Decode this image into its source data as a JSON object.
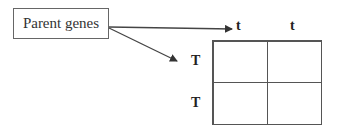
{
  "parent_box": {
    "label": "Parent genes"
  },
  "column_headers": [
    "t",
    "t"
  ],
  "row_headers": [
    "T",
    "T"
  ],
  "grid": {
    "rows": 2,
    "cols": 2,
    "cells": [
      [
        "",
        ""
      ],
      [
        "",
        ""
      ]
    ]
  }
}
